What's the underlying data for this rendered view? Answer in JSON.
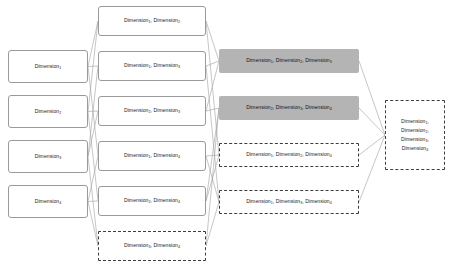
{
  "diagram": {
    "background": "#ffffff",
    "edge_color": "#a0a0a0",
    "fill_color": "#b4b4b4",
    "border_color": "#9a9a9a",
    "dashed_border_color": "#3d3d3d",
    "base_label": "Dimension",
    "separator": ", ",
    "columns": [
      {
        "name": "singletons",
        "nodes": [
          {
            "id": "d1",
            "style": "solid",
            "subscripts": [
              "1"
            ],
            "x": 8,
            "y": 50,
            "w": 80,
            "h": 33
          },
          {
            "id": "d2",
            "style": "solid",
            "subscripts": [
              "2"
            ],
            "x": 8,
            "y": 95,
            "w": 80,
            "h": 33
          },
          {
            "id": "d3",
            "style": "solid",
            "subscripts": [
              "3"
            ],
            "x": 8,
            "y": 140,
            "w": 80,
            "h": 33
          },
          {
            "id": "d4",
            "style": "solid",
            "subscripts": [
              "4"
            ],
            "x": 8,
            "y": 185,
            "w": 80,
            "h": 33
          }
        ]
      },
      {
        "name": "pairs",
        "nodes": [
          {
            "id": "p12",
            "style": "solid",
            "subscripts": [
              "1",
              "2"
            ],
            "x": 98,
            "y": 6,
            "w": 108,
            "h": 30
          },
          {
            "id": "p13",
            "style": "solid",
            "subscripts": [
              "1",
              "3"
            ],
            "x": 98,
            "y": 51,
            "w": 108,
            "h": 30
          },
          {
            "id": "p23",
            "style": "solid",
            "subscripts": [
              "2",
              "3"
            ],
            "x": 98,
            "y": 96,
            "w": 108,
            "h": 30
          },
          {
            "id": "p14",
            "style": "solid",
            "subscripts": [
              "1",
              "4"
            ],
            "x": 98,
            "y": 141,
            "w": 108,
            "h": 30
          },
          {
            "id": "p24",
            "style": "solid",
            "subscripts": [
              "2",
              "4"
            ],
            "x": 98,
            "y": 186,
            "w": 108,
            "h": 30
          },
          {
            "id": "p34",
            "style": "dashed",
            "subscripts": [
              "3",
              "4"
            ],
            "x": 98,
            "y": 231,
            "w": 108,
            "h": 30
          }
        ]
      },
      {
        "name": "triplets",
        "nodes": [
          {
            "id": "t123",
            "style": "filled",
            "subscripts": [
              "1",
              "2",
              "3"
            ],
            "x": 219,
            "y": 49,
            "w": 140,
            "h": 24
          },
          {
            "id": "t234",
            "style": "filled",
            "subscripts": [
              "2",
              "3",
              "4"
            ],
            "x": 219,
            "y": 96,
            "w": 140,
            "h": 24
          },
          {
            "id": "t124",
            "style": "dashed",
            "subscripts": [
              "1",
              "2",
              "4"
            ],
            "x": 219,
            "y": 143,
            "w": 140,
            "h": 24
          },
          {
            "id": "t134",
            "style": "dashed",
            "subscripts": [
              "1",
              "3",
              "4"
            ],
            "x": 219,
            "y": 190,
            "w": 140,
            "h": 24
          }
        ]
      },
      {
        "name": "full-set",
        "nodes": [
          {
            "id": "all",
            "style": "dashed",
            "subscripts": [
              "1",
              "2",
              "3",
              "4"
            ],
            "stacked": true,
            "x": 385,
            "y": 100,
            "w": 60,
            "h": 70
          }
        ]
      }
    ],
    "edges": [
      {
        "from": "d1",
        "to": "p12"
      },
      {
        "from": "d1",
        "to": "p13"
      },
      {
        "from": "d1",
        "to": "p14"
      },
      {
        "from": "d2",
        "to": "p12"
      },
      {
        "from": "d2",
        "to": "p23"
      },
      {
        "from": "d2",
        "to": "p24"
      },
      {
        "from": "d3",
        "to": "p13"
      },
      {
        "from": "d3",
        "to": "p23"
      },
      {
        "from": "d3",
        "to": "p34"
      },
      {
        "from": "d4",
        "to": "p14"
      },
      {
        "from": "d4",
        "to": "p24"
      },
      {
        "from": "d4",
        "to": "p34"
      },
      {
        "from": "p12",
        "to": "t123"
      },
      {
        "from": "p12",
        "to": "t124"
      },
      {
        "from": "p13",
        "to": "t123"
      },
      {
        "from": "p13",
        "to": "t134"
      },
      {
        "from": "p23",
        "to": "t123"
      },
      {
        "from": "p23",
        "to": "t234"
      },
      {
        "from": "p14",
        "to": "t124"
      },
      {
        "from": "p14",
        "to": "t134"
      },
      {
        "from": "p24",
        "to": "t124"
      },
      {
        "from": "p24",
        "to": "t234"
      },
      {
        "from": "p34",
        "to": "t134"
      },
      {
        "from": "p34",
        "to": "t234"
      },
      {
        "from": "t123",
        "to": "all"
      },
      {
        "from": "t234",
        "to": "all"
      },
      {
        "from": "t124",
        "to": "all"
      },
      {
        "from": "t134",
        "to": "all"
      }
    ]
  }
}
